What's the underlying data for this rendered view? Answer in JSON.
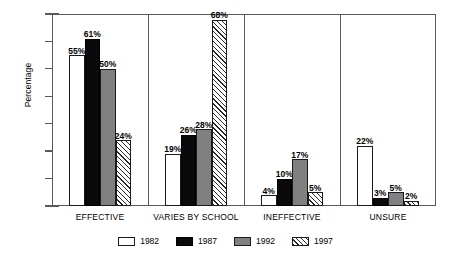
{
  "chart_data": {
    "type": "bar",
    "title": "",
    "subtitle": "",
    "xlabel": "",
    "ylabel": "Percentage",
    "ylim": [
      0,
      70
    ],
    "yticks": [
      0,
      10,
      20,
      30,
      40,
      50,
      60,
      70
    ],
    "ytick_labels": [
      "0",
      "10",
      "20",
      "30",
      "40",
      "50",
      "60",
      "70"
    ],
    "grid": false,
    "legend_position": "bottom",
    "value_labels_suffix": "%",
    "categories": [
      "EFFECTIVE",
      "VARIES BY SCHOOL",
      "INEFFECTIVE",
      "UNSURE"
    ],
    "series": [
      {
        "name": "1982",
        "color": "#ffffff",
        "pattern": "solid-white-outline",
        "values": [
          55,
          19,
          4,
          22
        ],
        "labels": [
          "55%",
          "19%",
          "4%",
          "22%"
        ]
      },
      {
        "name": "1987",
        "color": "#0a0a0a",
        "pattern": "solid-black",
        "values": [
          61,
          26,
          10,
          3
        ],
        "labels": [
          "61%",
          "26%",
          "10%",
          "3%"
        ]
      },
      {
        "name": "1992",
        "color": "#808080",
        "pattern": "solid-gray",
        "values": [
          50,
          28,
          17,
          5
        ],
        "labels": [
          "50%",
          "28%",
          "17%",
          "5%"
        ]
      },
      {
        "name": "1997",
        "color": "#ffffff",
        "pattern": "diagonal-hatch",
        "values": [
          24,
          68,
          5,
          2
        ],
        "labels": [
          "24%",
          "68%",
          "5%",
          "2%"
        ]
      }
    ]
  },
  "axis": {
    "y_title": "Percentage",
    "ticks": [
      {
        "label": "70"
      },
      {
        "label": "60"
      },
      {
        "label": "50"
      },
      {
        "label": "40"
      },
      {
        "label": "30"
      },
      {
        "label": "20"
      },
      {
        "label": "10"
      },
      {
        "label": "0"
      }
    ]
  },
  "categories": [
    {
      "label": "EFFECTIVE"
    },
    {
      "label": "VARIES BY SCHOOL"
    },
    {
      "label": "INEFFECTIVE"
    },
    {
      "label": "UNSURE"
    }
  ],
  "bars": {
    "effective": [
      {
        "label": "55%"
      },
      {
        "label": "61%"
      },
      {
        "label": "50%"
      },
      {
        "label": "24%"
      }
    ],
    "varies": [
      {
        "label": "19%"
      },
      {
        "label": "26%"
      },
      {
        "label": "28%"
      },
      {
        "label": "68%"
      }
    ],
    "ineffective": [
      {
        "label": "4%"
      },
      {
        "label": "10%"
      },
      {
        "label": "17%"
      },
      {
        "label": "5%"
      }
    ],
    "unsure": [
      {
        "label": "22%"
      },
      {
        "label": "3%"
      },
      {
        "label": "5%"
      },
      {
        "label": "2%"
      }
    ]
  },
  "legend": {
    "items": [
      {
        "label": "1982"
      },
      {
        "label": "1987"
      },
      {
        "label": "1992"
      },
      {
        "label": "1997"
      }
    ]
  },
  "colors": {
    "series_1982": "#ffffff",
    "series_1987": "#0a0a0a",
    "series_1992": "#808080",
    "series_1997": "#ffffff",
    "axis": "#59595b",
    "background": "#ffffff",
    "text": "#000000"
  }
}
